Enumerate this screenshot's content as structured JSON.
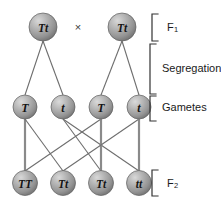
{
  "figure": {
    "cross_symbol": "×",
    "background_color": "#ffffff",
    "node_fill_color": "#9d9d9d",
    "node_edge_color": "#5f5f5f",
    "line_color": "#6e6e6e",
    "text_color": "#141414"
  },
  "rows": {
    "f1": {
      "label": "F",
      "label_sub": "1",
      "y": 27,
      "nodes": [
        {
          "genotype": "Tt",
          "x": 43,
          "r": 14
        },
        {
          "genotype": "Tt",
          "x": 122,
          "r": 14
        }
      ]
    },
    "gametes": {
      "label": "Gametes",
      "y": 107,
      "nodes": [
        {
          "genotype": "T",
          "x": 25,
          "r": 12
        },
        {
          "genotype": "t",
          "x": 63,
          "r": 12
        },
        {
          "genotype": "T",
          "x": 101,
          "r": 12
        },
        {
          "genotype": "t",
          "x": 139,
          "r": 12
        }
      ]
    },
    "f2": {
      "label": "F",
      "label_sub": "2",
      "y": 183,
      "nodes": [
        {
          "genotype": "TT",
          "x": 25,
          "r": 12.5
        },
        {
          "genotype": "Tt",
          "x": 63,
          "r": 12.5
        },
        {
          "genotype": "Tt",
          "x": 101,
          "r": 12.5
        },
        {
          "genotype": "tt",
          "x": 139,
          "r": 12.5
        }
      ]
    }
  },
  "segregation": {
    "label": "Segregation"
  },
  "side_labels": [
    {
      "name": "f1-label",
      "text": "F",
      "sub": "1",
      "x": 167,
      "y": 27
    },
    {
      "name": "segregation-label",
      "text": "Segregation",
      "sub": "",
      "x": 162,
      "y": 68
    },
    {
      "name": "gametes-label",
      "text": "Gametes",
      "sub": "",
      "x": 162,
      "y": 107
    },
    {
      "name": "f2-label",
      "text": "F",
      "sub": "2",
      "x": 167,
      "y": 183
    }
  ],
  "brackets": [
    {
      "name": "bracket-f1",
      "x": 152,
      "top": 14,
      "bottom": 41,
      "arm": 6
    },
    {
      "name": "bracket-segregation",
      "x": 150,
      "top": 44,
      "bottom": 94,
      "arm": 6
    },
    {
      "name": "bracket-gametes",
      "x": 150,
      "top": 96,
      "bottom": 121,
      "arm": 6
    },
    {
      "name": "bracket-f2",
      "x": 152,
      "top": 170,
      "bottom": 196,
      "arm": 6
    }
  ],
  "edges_f1_to_gametes": [
    {
      "from": "f1-left",
      "to": "gamete-1",
      "x1": 43,
      "y1": 41,
      "x2": 25,
      "y2": 95
    },
    {
      "from": "f1-left",
      "to": "gamete-2",
      "x1": 43,
      "y1": 41,
      "x2": 63,
      "y2": 95
    },
    {
      "from": "f1-right",
      "to": "gamete-3",
      "x1": 122,
      "y1": 41,
      "x2": 101,
      "y2": 95
    },
    {
      "from": "f1-right",
      "to": "gamete-4",
      "x1": 122,
      "y1": 41,
      "x2": 139,
      "y2": 95
    }
  ],
  "edges_gametes_to_f2": [
    {
      "from": "gamete-1",
      "to": "f2-1",
      "x1": 25,
      "y1": 119,
      "x2": 25,
      "y2": 171,
      "weight": "thick"
    },
    {
      "from": "gamete-1",
      "to": "f2-2",
      "x1": 25,
      "y1": 119,
      "x2": 63,
      "y2": 171,
      "weight": "thin"
    },
    {
      "from": "gamete-2",
      "to": "f2-3",
      "x1": 63,
      "y1": 119,
      "x2": 101,
      "y2": 171,
      "weight": "thin"
    },
    {
      "from": "gamete-2",
      "to": "f2-4",
      "x1": 63,
      "y1": 119,
      "x2": 139,
      "y2": 171,
      "weight": "thin"
    },
    {
      "from": "gamete-3",
      "to": "f2-1",
      "x1": 101,
      "y1": 119,
      "x2": 25,
      "y2": 171,
      "weight": "thin"
    },
    {
      "from": "gamete-3",
      "to": "f2-3",
      "x1": 101,
      "y1": 119,
      "x2": 101,
      "y2": 171,
      "weight": "thick"
    },
    {
      "from": "gamete-4",
      "to": "f2-2",
      "x1": 139,
      "y1": 119,
      "x2": 63,
      "y2": 171,
      "weight": "thin"
    },
    {
      "from": "gamete-4",
      "to": "f2-4",
      "x1": 139,
      "y1": 119,
      "x2": 139,
      "y2": 171,
      "weight": "thick"
    }
  ],
  "cross": {
    "symbol": "×",
    "x": 78,
    "y": 27
  }
}
